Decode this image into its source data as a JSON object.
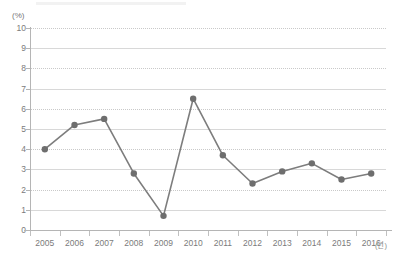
{
  "chart_data": {
    "type": "line",
    "title": "",
    "xlabel": "(년)",
    "ylabel": "(%)",
    "categories": [
      "2005",
      "2006",
      "2007",
      "2008",
      "2009",
      "2010",
      "2011",
      "2012",
      "2013",
      "2014",
      "2015",
      "2016"
    ],
    "values": [
      4.0,
      5.2,
      5.5,
      2.8,
      0.7,
      6.5,
      3.7,
      2.3,
      2.9,
      3.3,
      2.5,
      2.8
    ],
    "series": [
      {
        "name": "",
        "values": [
          4.0,
          5.2,
          5.5,
          2.8,
          0.7,
          6.5,
          3.7,
          2.3,
          2.9,
          3.3,
          2.5,
          2.8
        ]
      }
    ],
    "ylim": [
      0,
      10
    ],
    "y_ticks": [
      "0",
      "1",
      "2",
      "3",
      "4",
      "5",
      "6",
      "7",
      "8",
      "9",
      "10"
    ],
    "y_unit": "(%)",
    "x_unit": "(년)",
    "grid": true,
    "grid_axis": "y",
    "legend": "none",
    "marker": "circle",
    "colors": {
      "line": "#7d7d7d",
      "marker": "#6e6e6e",
      "gridline_solid": "#d8d8d8",
      "gridline_dotted": "#c9c9c9",
      "axis": "#b5b5b5",
      "text": "#7b7b7b",
      "background": "#ffffff"
    }
  }
}
